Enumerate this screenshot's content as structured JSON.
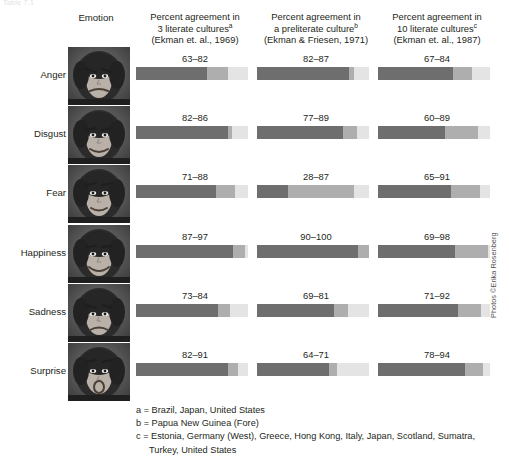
{
  "figure": {
    "cut_caption": "Table 7.1",
    "emotion_column_header": "Emotion",
    "photo_credit": "Photos ©Erika Rosenberg"
  },
  "columns": [
    {
      "line1": "Percent agreement in",
      "line2": "3 literate cultures",
      "marker": "a",
      "line3": "(Ekman et. al., 1969)"
    },
    {
      "line1": "Percent agreement in",
      "line2": "a preliterate culture",
      "marker": "b",
      "line3": "(Ekman & Friesen, 1971)"
    },
    {
      "line1": "Percent agreement in",
      "line2": "10 literate cultures",
      "marker": "c",
      "line3": "(Ekman et. al., 1987)"
    }
  ],
  "footnotes": [
    "a = Brazil, Japan, United States",
    "b = Papua New Guinea (Fore)",
    "c = Estonia, Germany (West), Greece, Hong Kong, Italy, Japan, Scotland, Sumatra,",
    "Turkey, United States"
  ],
  "colors": {
    "segment_low": "#6e6e6e",
    "segment_range": "#aeaeae",
    "segment_remainder": "#e4e4e4",
    "text": "#231f20",
    "background": "#ffffff"
  },
  "chart_data": {
    "type": "bar",
    "subtype": "range-bar (stacked: 0-low dark, low-high medium, high-100 light)",
    "xlabel": "Percent agreement",
    "ylabel": "Emotion",
    "xlim": [
      0,
      100
    ],
    "grid": false,
    "legend": "none",
    "categories": [
      "Anger",
      "Disgust",
      "Fear",
      "Happiness",
      "Sadness",
      "Surprise"
    ],
    "series": [
      {
        "name": "3 literate cultures (Ekman et. al., 1969)",
        "label": "3 literate cultures",
        "marker": "a",
        "ranges": [
          {
            "emotion": "Anger",
            "low": 63,
            "high": 82,
            "label": "63–82"
          },
          {
            "emotion": "Disgust",
            "low": 82,
            "high": 86,
            "label": "82–86"
          },
          {
            "emotion": "Fear",
            "low": 71,
            "high": 88,
            "label": "71–88"
          },
          {
            "emotion": "Happiness",
            "low": 87,
            "high": 97,
            "label": "87–97"
          },
          {
            "emotion": "Sadness",
            "low": 73,
            "high": 84,
            "label": "73–84"
          },
          {
            "emotion": "Surprise",
            "low": 82,
            "high": 91,
            "label": "82–91"
          }
        ]
      },
      {
        "name": "a preliterate culture (Ekman & Friesen, 1971)",
        "label": "a preliterate culture",
        "marker": "b",
        "ranges": [
          {
            "emotion": "Anger",
            "low": 82,
            "high": 87,
            "label": "82–87"
          },
          {
            "emotion": "Disgust",
            "low": 77,
            "high": 89,
            "label": "77–89"
          },
          {
            "emotion": "Fear",
            "low": 28,
            "high": 87,
            "label": "28–87"
          },
          {
            "emotion": "Happiness",
            "low": 90,
            "high": 100,
            "label": "90–100"
          },
          {
            "emotion": "Sadness",
            "low": 69,
            "high": 81,
            "label": "69–81"
          },
          {
            "emotion": "Surprise",
            "low": 64,
            "high": 71,
            "label": "64–71"
          }
        ]
      },
      {
        "name": "10 literate cultures (Ekman et. al., 1987)",
        "label": "10 literate cultures",
        "marker": "c",
        "ranges": [
          {
            "emotion": "Anger",
            "low": 67,
            "high": 84,
            "label": "67–84"
          },
          {
            "emotion": "Disgust",
            "low": 60,
            "high": 89,
            "label": "60–89"
          },
          {
            "emotion": "Fear",
            "low": 65,
            "high": 91,
            "label": "65–91"
          },
          {
            "emotion": "Happiness",
            "low": 69,
            "high": 98,
            "label": "69–98"
          },
          {
            "emotion": "Sadness",
            "low": 71,
            "high": 92,
            "label": "71–92"
          },
          {
            "emotion": "Surprise",
            "low": 78,
            "high": 94,
            "label": "78–94"
          }
        ]
      }
    ]
  }
}
